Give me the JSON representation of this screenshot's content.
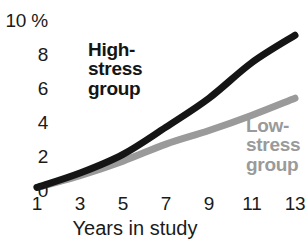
{
  "chart_data": {
    "type": "line",
    "title": "",
    "subtitle": "",
    "xlabel": "Years in study",
    "ylabel": "",
    "x": [
      1,
      3,
      5,
      7,
      9,
      11,
      13
    ],
    "xticklabels": [
      "1",
      "3",
      "5",
      "7",
      "9",
      "11",
      "13"
    ],
    "yticklabels": [
      "10 %",
      "8",
      "6",
      "4",
      "2",
      "0"
    ],
    "ytickvalues": [
      10,
      8,
      6,
      4,
      2,
      0
    ],
    "xlim": [
      1,
      13
    ],
    "ylim": [
      0,
      10
    ],
    "grid": false,
    "legend_position": "inline-annotation",
    "units": "%",
    "series": [
      {
        "name": "High-stress group",
        "label_lines": [
          "High-",
          "stress",
          "group"
        ],
        "color": "#151515",
        "values": [
          0.15,
          1.0,
          2.1,
          3.7,
          5.4,
          7.5,
          9.1
        ]
      },
      {
        "name": "Low-stress group",
        "label_lines": [
          "Low-",
          "stress",
          "group"
        ],
        "color": "#9a9a9a",
        "values": [
          0.15,
          0.85,
          1.7,
          2.7,
          3.5,
          4.4,
          5.4
        ]
      }
    ]
  },
  "axes": {
    "y_ticks": [
      {
        "label": "10 %",
        "value": 10
      },
      {
        "label": "8",
        "value": 8
      },
      {
        "label": "6",
        "value": 6
      },
      {
        "label": "4",
        "value": 4
      },
      {
        "label": "2",
        "value": 2
      },
      {
        "label": "0",
        "value": 0
      }
    ],
    "x_ticks": [
      {
        "label": "1",
        "value": 1
      },
      {
        "label": "3",
        "value": 3
      },
      {
        "label": "5",
        "value": 5
      },
      {
        "label": "7",
        "value": 7
      },
      {
        "label": "9",
        "value": 9
      },
      {
        "label": "11",
        "value": 11
      },
      {
        "label": "13",
        "value": 13
      }
    ],
    "x_axis_title": "Years in study"
  },
  "legend": {
    "high": {
      "line1": "High-",
      "line2": "stress",
      "line3": "group"
    },
    "low": {
      "line1": "Low-",
      "line2": "stress",
      "line3": "group"
    }
  }
}
